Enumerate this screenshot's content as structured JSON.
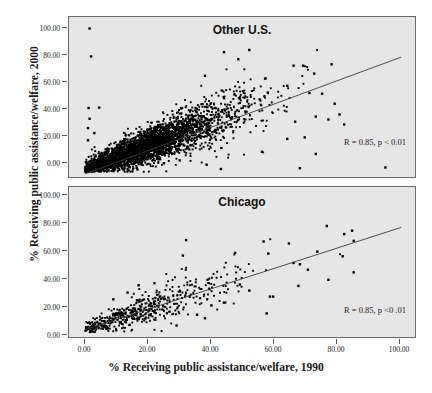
{
  "chart_data": {
    "type": "scatter",
    "title": "",
    "xlabel": "% Receiving public assistance/welfare, 1990",
    "ylabel": "% Receiving public assistance/welfare, 2000",
    "xlim": [
      -5,
      105
    ],
    "ylim": [
      -5,
      108
    ],
    "xticks": [
      "0.00",
      "20.00",
      "40.00",
      "60.00",
      "80.00",
      "100.00"
    ],
    "xtick_values": [
      0,
      20,
      40,
      60,
      80,
      100
    ],
    "yticks": [
      "0.00",
      "20.00",
      "40.00",
      "60.00",
      "80.00",
      "100.00"
    ],
    "ytick_values": [
      0,
      20,
      40,
      60,
      80,
      100
    ],
    "grid": false,
    "legend": "none",
    "marker": "square",
    "marker_color": "#000000",
    "plot_background": "#e6e6e6",
    "panels": [
      {
        "name": "other-us",
        "title": "Other U.S.",
        "annotation": "R = 0.85, p < 0.01",
        "r": 0.85,
        "p_text": "p < 0.01",
        "n_points": 3200,
        "regression": {
          "x0": 0,
          "y0": -1.5,
          "x1": 100,
          "y1": 80
        },
        "density": "very-high",
        "cluster": {
          "x_mean": 22,
          "x_sd": 13,
          "slope": 0.82,
          "intercept": 2.0,
          "resid_sd": 7.5
        },
        "outliers": [
          [
            1.5,
            100.0
          ],
          [
            2.0,
            80.5
          ],
          [
            1.2,
            44.5
          ],
          [
            4.5,
            44.8
          ],
          [
            1.5,
            37.0
          ],
          [
            1.0,
            30.5
          ],
          [
            3.0,
            27.0
          ],
          [
            1.0,
            22.0
          ],
          [
            44.0,
            83.5
          ],
          [
            52.0,
            85.0
          ],
          [
            48.5,
            78.5
          ],
          [
            38.0,
            67.0
          ],
          [
            66.0,
            74.0
          ],
          [
            69.0,
            74.0
          ],
          [
            78.0,
            75.0
          ],
          [
            72.5,
            68.5
          ],
          [
            57.0,
            65.0
          ],
          [
            64.0,
            60.0
          ],
          [
            71.0,
            55.0
          ],
          [
            75.0,
            54.5
          ],
          [
            79.0,
            47.5
          ],
          [
            80.5,
            40.0
          ],
          [
            82.0,
            33.0
          ],
          [
            77.0,
            36.5
          ],
          [
            73.0,
            38.5
          ],
          [
            66.5,
            35.0
          ],
          [
            69.5,
            24.0
          ],
          [
            64.0,
            23.0
          ],
          [
            73.0,
            12.5
          ],
          [
            56.0,
            14.0
          ],
          [
            38.5,
            5.0
          ],
          [
            43.0,
            2.0
          ],
          [
            95.0,
            3.0
          ],
          [
            68.0,
            2.5
          ],
          [
            30.0,
            8.0
          ],
          [
            25.0,
            6.0
          ]
        ]
      },
      {
        "name": "chicago",
        "title": "Chicago",
        "annotation": "R = 0.85, p <0 .01",
        "r": 0.85,
        "p_text": "p <0 .01",
        "n_points": 520,
        "regression": {
          "x0": 0,
          "y0": 2.0,
          "x1": 100,
          "y1": 78
        },
        "density": "medium",
        "cluster": {
          "x_mean": 20,
          "x_sd": 14,
          "slope": 0.76,
          "intercept": 2.5,
          "resid_sd": 7.0
        },
        "outliers": [
          [
            32.0,
            68.5
          ],
          [
            31.0,
            57.0
          ],
          [
            56.5,
            67.5
          ],
          [
            58.0,
            58.5
          ],
          [
            47.5,
            59.0
          ],
          [
            64.5,
            66.0
          ],
          [
            76.5,
            79.0
          ],
          [
            82.0,
            73.0
          ],
          [
            84.5,
            75.5
          ],
          [
            85.0,
            68.0
          ],
          [
            81.5,
            56.5
          ],
          [
            73.5,
            60.0
          ],
          [
            68.0,
            50.5
          ],
          [
            70.5,
            46.5
          ],
          [
            66.0,
            51.5
          ],
          [
            85.0,
            44.5
          ],
          [
            77.0,
            39.0
          ],
          [
            67.5,
            34.5
          ],
          [
            59.5,
            26.5
          ],
          [
            58.5,
            26.5
          ],
          [
            57.5,
            14.0
          ],
          [
            38.0,
            10.5
          ],
          [
            29.0,
            5.0
          ],
          [
            49.0,
            35.5
          ],
          [
            52.0,
            31.0
          ],
          [
            44.0,
            22.0
          ],
          [
            40.0,
            20.0
          ],
          [
            35.5,
            13.0
          ],
          [
            22.0,
            36.5
          ],
          [
            17.0,
            35.0
          ],
          [
            13.5,
            29.5
          ],
          [
            9.0,
            24.5
          ]
        ]
      }
    ]
  }
}
